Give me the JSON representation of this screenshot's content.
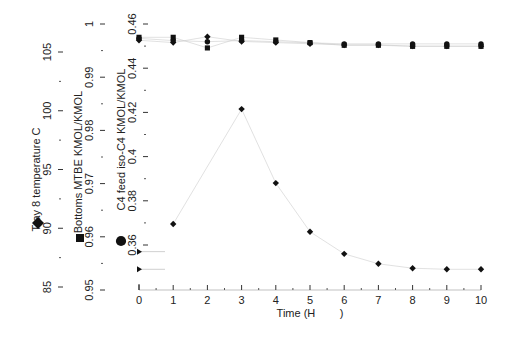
{
  "chart_data": {
    "type": "scatter",
    "title": "",
    "xlabel": "Time (H        )",
    "x_ticks": [
      "0",
      "1",
      "2",
      "3",
      "4",
      "5",
      "6",
      "7",
      "8",
      "9",
      "10"
    ],
    "xlim": [
      0,
      10
    ],
    "y_axes": [
      {
        "label": "Tray 8 temperature C",
        "ticks": [
          "85",
          "90",
          "95",
          "100",
          "105"
        ],
        "ylim": [
          85,
          107
        ],
        "marker": "diamond"
      },
      {
        "label": "Bottoms MTBE KMOL/KMOL",
        "ticks": [
          "0.95",
          "0.96",
          "0.97",
          "0.98",
          "0.99",
          "1"
        ],
        "ylim": [
          0.95,
          1.0
        ],
        "marker": "square"
      },
      {
        "label": "C4 feed iso-C4 KMOL/KMOL",
        "ticks": [
          "0.36",
          "0.38",
          "0.4",
          "0.42",
          "0.44",
          "0.46"
        ],
        "ylim": [
          0.355,
          0.46
        ],
        "marker": "circle"
      }
    ],
    "series": [
      {
        "name": "Tray 8 temperature C",
        "marker": "diamond",
        "axis": 0,
        "x": [
          0,
          1,
          2,
          3,
          4,
          5,
          6,
          7,
          8,
          9,
          10
        ],
        "values": [
          106.0,
          105.8,
          106.3,
          105.9,
          105.8,
          105.7,
          105.6,
          105.6,
          105.5,
          105.5,
          105.5
        ]
      },
      {
        "name": "Bottoms MTBE KMOL/KMOL",
        "marker": "square",
        "axis": 1,
        "x": [
          0,
          1,
          2,
          3,
          4,
          5,
          6,
          7,
          8,
          9,
          10
        ],
        "values": [
          0.9975,
          0.9975,
          0.9955,
          0.9975,
          0.997,
          0.9965,
          0.996,
          0.996,
          0.9958,
          0.9958,
          0.9958
        ]
      },
      {
        "name": "C4 feed iso-C4 KMOL/KMOL",
        "marker": "circle",
        "axis": 2,
        "x": [
          0,
          1,
          2,
          3,
          4,
          5,
          6,
          7,
          8,
          9,
          10
        ],
        "values": [
          0.4535,
          0.4525,
          0.452,
          0.4525,
          0.452,
          0.4515,
          0.451,
          0.451,
          0.451,
          0.451,
          0.451
        ]
      },
      {
        "name": "Response (diamond, iso-C4 scale)",
        "marker": "diamond",
        "axis": 2,
        "x": [
          1,
          3,
          4,
          5,
          6,
          7,
          8,
          9,
          10
        ],
        "values": [
          0.3695,
          0.4215,
          0.388,
          0.366,
          0.356,
          0.3515,
          0.3495,
          0.349,
          0.349
        ]
      },
      {
        "name": "Initial marker upper",
        "marker": "triangle",
        "axis": 2,
        "x": [
          0
        ],
        "values": [
          0.357
        ]
      },
      {
        "name": "Initial marker lower",
        "marker": "triangle",
        "axis": 2,
        "x": [
          0
        ],
        "values": [
          0.349
        ]
      }
    ],
    "grid": false,
    "legend": "markers beside each y-axis title (diamond, square, circle)"
  },
  "axes": {
    "x": {
      "title": "Time (H        )",
      "ticks": [
        "0",
        "1",
        "2",
        "3",
        "4",
        "5",
        "6",
        "7",
        "8",
        "9",
        "10"
      ]
    },
    "y1": {
      "title": "Tray 8 temperature C",
      "ticks": [
        "85",
        "90",
        "95",
        "100",
        "105"
      ]
    },
    "y2": {
      "title": "Bottoms MTBE KMOL/KMOL",
      "ticks": [
        "0.95",
        "0.96",
        "0.97",
        "0.98",
        "0.99",
        "1"
      ]
    },
    "y3": {
      "title": "C4 feed iso-C4 KMOL/KMOL",
      "ticks": [
        "0.36",
        "0.38",
        "0.4",
        "0.42",
        "0.44",
        "0.46"
      ]
    }
  }
}
